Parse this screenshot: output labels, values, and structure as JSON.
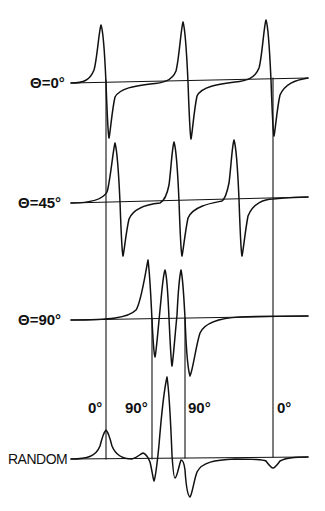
{
  "figure": {
    "type": "epr-spectra-orientation-dependence",
    "colors": {
      "ink": "#111111",
      "background": "#ffffff"
    },
    "rows": [
      {
        "label": "Θ=0°",
        "baseline_y_left": 83,
        "baseline_y_right": 78,
        "lines": [
          {
            "peak_x": 101,
            "peak_y": 25,
            "trough_x": 109,
            "trough_y": 138
          },
          {
            "peak_x": 183,
            "peak_y": 22,
            "trough_x": 191,
            "trough_y": 139
          },
          {
            "peak_x": 266,
            "peak_y": 20,
            "trough_x": 274,
            "trough_y": 136
          }
        ]
      },
      {
        "label": "Θ=45°",
        "baseline_y_left": 203,
        "baseline_y_right": 197,
        "lines": [
          {
            "peak_x": 115,
            "peak_y": 143,
            "trough_x": 123,
            "trough_y": 256
          },
          {
            "peak_x": 174,
            "peak_y": 142,
            "trough_x": 182,
            "trough_y": 256
          },
          {
            "peak_x": 234,
            "peak_y": 140,
            "trough_x": 242,
            "trough_y": 256
          }
        ]
      },
      {
        "label": "Θ=90°",
        "baseline_y_left": 320,
        "baseline_y_right": 316,
        "lines": [
          {
            "peak_x": 148,
            "peak_y": 260,
            "trough_x": 155,
            "trough_y": 357
          },
          {
            "peak_x": 165,
            "peak_y": 270,
            "trough_x": 172,
            "trough_y": 366
          },
          {
            "peak_x": 181,
            "peak_y": 270,
            "trough_x": 190,
            "trough_y": 376
          }
        ]
      },
      {
        "label": "RANDOM",
        "baseline_y_left": 459,
        "baseline_y_right": 457,
        "features": [
          {
            "type": "absorption-peak",
            "x": 106,
            "y": 430,
            "assignment": "0°"
          },
          {
            "type": "small-bump",
            "x": 143,
            "y": 453
          },
          {
            "type": "dip",
            "x": 154,
            "y": 481
          },
          {
            "type": "major-peak",
            "x": 167,
            "y": 377
          },
          {
            "type": "dip",
            "x": 175,
            "y": 478
          },
          {
            "type": "dip",
            "x": 190,
            "y": 497
          },
          {
            "type": "small-dip",
            "x": 273,
            "y": 468,
            "assignment": "0°"
          }
        ]
      }
    ],
    "vertical_markers": [
      {
        "label": "0°",
        "x": 106
      },
      {
        "label": "90°",
        "x": 152
      },
      {
        "label": "90°",
        "x": 185
      },
      {
        "label": "0°",
        "x": 273
      }
    ]
  }
}
